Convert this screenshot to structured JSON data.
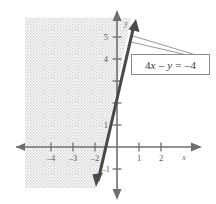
{
  "figure": {
    "kind": "coordinate-plane-inequality-graph",
    "axis_labels": {
      "x": "x",
      "y": "y"
    },
    "x_ticks": [
      {
        "value": -4,
        "label": "–4",
        "px": 51
      },
      {
        "value": -3,
        "label": "–3",
        "px": 73
      },
      {
        "value": -2,
        "label": "–2",
        "px": 95
      },
      {
        "value": 1,
        "label": "1",
        "px": 139
      },
      {
        "value": 2,
        "label": "2",
        "px": 161
      }
    ],
    "y_ticks": [
      {
        "value": 5,
        "label": "5",
        "px": 37
      },
      {
        "value": 4,
        "label": "4",
        "px": 59
      },
      {
        "value": 3,
        "label": "",
        "px": 81
      },
      {
        "value": 2,
        "label": "",
        "px": 103
      },
      {
        "value": 1,
        "label": "1",
        "px": 125
      },
      {
        "value": -1,
        "label": "–1",
        "px": 169
      }
    ],
    "origin": {
      "x": 117,
      "y": 147
    },
    "unit_px": 22,
    "boundary_line": {
      "equation_label": "4x – y = –4",
      "slope": 4,
      "y_intercept": 4,
      "x_intercept": -1,
      "style": "solid",
      "arrows": "both-ends"
    },
    "shaded_region": {
      "description": "region left of the boundary line",
      "pattern": "stipple",
      "color": "#d5d5d5"
    },
    "callout": {
      "text_parts": {
        "a": "4",
        "x": "x",
        "minus": "–",
        "y": "y",
        "eq": "=",
        "rhs": "–4"
      },
      "full_text": "4x – y = –4"
    },
    "colors": {
      "axis": "#6f6f6f",
      "line": "#4a4a4a",
      "shade": "#d6d6d6",
      "text": "#5a5a5a",
      "box_border": "#8a8a8a",
      "background": "#ffffff"
    }
  }
}
